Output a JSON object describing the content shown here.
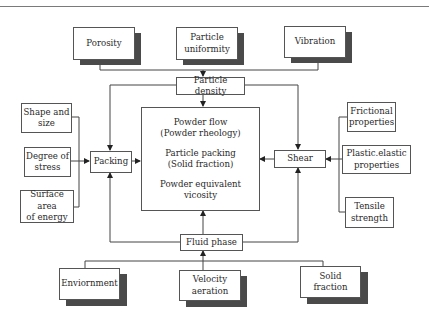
{
  "diagram": {
    "top_factors": [
      {
        "id": "porosity",
        "label": "Porosity"
      },
      {
        "id": "particle-uniformity",
        "label": "Particle\nuniformity"
      },
      {
        "id": "vibration",
        "label": "Vibration"
      }
    ],
    "particle_density": {
      "label": "Particle density"
    },
    "central": {
      "items": [
        {
          "line1": "Powder flow",
          "line2": "(Powder rheology)"
        },
        {
          "line1": "Particle packing",
          "line2": "(Solid fraction)"
        },
        {
          "line1": "Powder equivalent",
          "line2": "vicosity"
        }
      ]
    },
    "packing": {
      "label": "Packing"
    },
    "shear": {
      "label": "Shear"
    },
    "fluid_phase": {
      "label": "Fluid phase"
    },
    "left_factors": [
      {
        "id": "shape-and-size",
        "label": "Shape and\nsize"
      },
      {
        "id": "degree-of-stress",
        "label": "Degree of\nstress"
      },
      {
        "id": "surface-area-of-energy",
        "label": "Surface area\nof energy"
      }
    ],
    "right_factors": [
      {
        "id": "frictional-properties",
        "label": "Frictional\nproperties"
      },
      {
        "id": "plastic-elastic-properties",
        "label": "Plastic.elastic\nproperties"
      },
      {
        "id": "tensile-strength",
        "label": "Tensile\nstrength"
      }
    ],
    "bottom_factors": [
      {
        "id": "enviornment",
        "label": "Enviornment"
      },
      {
        "id": "velocity-aeration",
        "label": "Velocity\naeration"
      },
      {
        "id": "solid-fraction",
        "label": "Solid\nfraction"
      }
    ],
    "colors": {
      "line": "#444444",
      "shadow": "#4a4a4a",
      "border": "#555555",
      "rule": "#7a7a7a"
    }
  }
}
